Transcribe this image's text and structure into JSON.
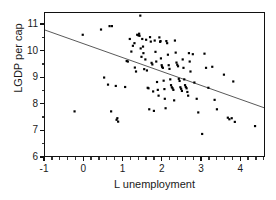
{
  "figure": {
    "cut_off_caption": "",
    "background_color": "#ffffff",
    "point_color": "#000000",
    "line_color": "#444444",
    "axis_color": "#111111"
  },
  "chart_data": {
    "type": "scatter",
    "title": "",
    "xlabel": "L unemployment",
    "ylabel": "LGDP per cap",
    "xlim": [
      -1,
      4.63
    ],
    "ylim": [
      6,
      11.45
    ],
    "grid": false,
    "legend": null,
    "xticks": [
      -1,
      0,
      1,
      2,
      3,
      4
    ],
    "xtick_labels": [
      "-1",
      "0",
      "1",
      "2",
      "3",
      "4"
    ],
    "x_minor_step": 0.2,
    "yticks": [
      6,
      7,
      8,
      9,
      10,
      11
    ],
    "ytick_labels": [
      "6",
      "7",
      "8",
      "9",
      "10",
      "11"
    ],
    "y_minor_step": 0.5,
    "marker": "square",
    "marker_size": 2.2,
    "points": [
      [
        -0.24,
        7.7
      ],
      [
        -0.03,
        10.62
      ],
      [
        0.44,
        10.82
      ],
      [
        0.52,
        8.99
      ],
      [
        0.62,
        8.72
      ],
      [
        0.66,
        10.95
      ],
      [
        0.72,
        10.95
      ],
      [
        0.7,
        7.7
      ],
      [
        0.82,
        8.67
      ],
      [
        0.84,
        7.38
      ],
      [
        0.88,
        7.31
      ],
      [
        0.86,
        7.44
      ],
      [
        1.06,
        8.63
      ],
      [
        1.1,
        9.62
      ],
      [
        1.13,
        9.6
      ],
      [
        1.18,
        10.46
      ],
      [
        1.22,
        9.98
      ],
      [
        1.26,
        10.2
      ],
      [
        1.3,
        10.3
      ],
      [
        1.31,
        9.37
      ],
      [
        1.34,
        9.22
      ],
      [
        1.37,
        10.62
      ],
      [
        1.4,
        10.6
      ],
      [
        1.42,
        10.66
      ],
      [
        1.43,
        10.58
      ],
      [
        1.45,
        11.35
      ],
      [
        1.46,
        10.1
      ],
      [
        1.48,
        9.78
      ],
      [
        1.5,
        10.46
      ],
      [
        1.52,
        10.17
      ],
      [
        1.53,
        9.92
      ],
      [
        1.55,
        9.31
      ],
      [
        1.58,
        9.68
      ],
      [
        1.6,
        10.43
      ],
      [
        1.62,
        9.26
      ],
      [
        1.64,
        8.6
      ],
      [
        1.66,
        8.58
      ],
      [
        1.68,
        7.78
      ],
      [
        1.7,
        10.53
      ],
      [
        1.72,
        10.36
      ],
      [
        1.74,
        9.55
      ],
      [
        1.76,
        9.49
      ],
      [
        1.78,
        8.46
      ],
      [
        1.8,
        7.72
      ],
      [
        1.82,
        10.4
      ],
      [
        1.84,
        9.97
      ],
      [
        1.86,
        9.6
      ],
      [
        1.88,
        8.82
      ],
      [
        1.9,
        8.52
      ],
      [
        1.92,
        8.3
      ],
      [
        1.94,
        10.52
      ],
      [
        1.96,
        10.35
      ],
      [
        1.97,
        10.38
      ],
      [
        1.98,
        9.72
      ],
      [
        2.0,
        9.46
      ],
      [
        2.01,
        9.4
      ],
      [
        2.03,
        9.36
      ],
      [
        2.05,
        8.87
      ],
      [
        2.07,
        8.55
      ],
      [
        2.08,
        8.18
      ],
      [
        2.1,
        7.82
      ],
      [
        2.12,
        10.38
      ],
      [
        2.14,
        10.3
      ],
      [
        2.16,
        9.86
      ],
      [
        2.18,
        9.46
      ],
      [
        2.2,
        9.32
      ],
      [
        2.22,
        8.92
      ],
      [
        2.24,
        8.7
      ],
      [
        2.26,
        8.62
      ],
      [
        2.28,
        8.58
      ],
      [
        2.3,
        8.52
      ],
      [
        2.32,
        8.12
      ],
      [
        2.34,
        10.4
      ],
      [
        2.36,
        9.94
      ],
      [
        2.38,
        9.56
      ],
      [
        2.4,
        9.48
      ],
      [
        2.42,
        9.42
      ],
      [
        2.44,
        8.94
      ],
      [
        2.46,
        8.86
      ],
      [
        2.48,
        8.62
      ],
      [
        2.5,
        8.56
      ],
      [
        2.52,
        8.48
      ],
      [
        2.54,
        9.68
      ],
      [
        2.56,
        9.36
      ],
      [
        2.58,
        8.92
      ],
      [
        2.6,
        8.7
      ],
      [
        2.62,
        8.63
      ],
      [
        2.64,
        8.58
      ],
      [
        2.66,
        8.44
      ],
      [
        2.68,
        8.3
      ],
      [
        2.7,
        9.92
      ],
      [
        2.72,
        9.6
      ],
      [
        2.74,
        9.22
      ],
      [
        2.8,
        9.88
      ],
      [
        2.84,
        8.8
      ],
      [
        2.9,
        8.18
      ],
      [
        2.94,
        7.66
      ],
      [
        3.04,
        6.84
      ],
      [
        3.1,
        9.9
      ],
      [
        3.14,
        9.36
      ],
      [
        3.2,
        8.6
      ],
      [
        3.3,
        9.4
      ],
      [
        3.36,
        8.14
      ],
      [
        3.42,
        7.78
      ],
      [
        3.6,
        9.1
      ],
      [
        3.7,
        7.46
      ],
      [
        3.74,
        7.4
      ],
      [
        3.8,
        7.44
      ],
      [
        3.84,
        8.84
      ],
      [
        3.88,
        7.3
      ],
      [
        4.4,
        7.14
      ]
    ],
    "fit_line": {
      "label": "regression line",
      "x_start": -1,
      "y_start": 10.8,
      "x_end": 4.63,
      "y_end": 7.84
    }
  }
}
